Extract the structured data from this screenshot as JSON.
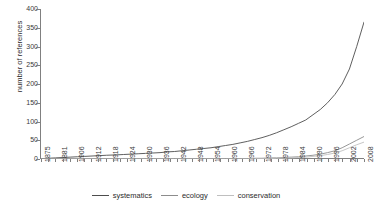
{
  "chart_data": {
    "type": "line",
    "title": "",
    "xlabel": "",
    "ylabel": "number of references",
    "ylim": [
      0,
      400
    ],
    "ytick_values": [
      0,
      50,
      100,
      150,
      200,
      250,
      300,
      350,
      400
    ],
    "grid": false,
    "legend_position": "bottom",
    "xlim": [
      1875,
      2008
    ],
    "xtick_labels": [
      "1875",
      "1881",
      "1906",
      "1912",
      "1918",
      "1924",
      "1930",
      "1936",
      "1942",
      "1948",
      "1954",
      "1960",
      "1966",
      "1972",
      "1978",
      "1984",
      "1990",
      "1996",
      "2002",
      "2008"
    ],
    "x": [
      1875,
      1878,
      1881,
      1884,
      1887,
      1890,
      1893,
      1896,
      1899,
      1902,
      1906,
      1909,
      1912,
      1915,
      1918,
      1921,
      1924,
      1927,
      1930,
      1933,
      1936,
      1939,
      1942,
      1945,
      1948,
      1951,
      1954,
      1957,
      1960,
      1963,
      1966,
      1969,
      1972,
      1975,
      1978,
      1981,
      1984,
      1987,
      1990,
      1993,
      1996,
      1999,
      2002,
      2005,
      2008
    ],
    "series": [
      {
        "name": "systematics",
        "color": "#4d4d4d",
        "values": [
          1,
          2,
          3,
          4,
          5,
          6,
          7,
          8,
          9,
          10,
          11,
          12,
          13,
          14,
          15,
          16,
          17,
          19,
          20,
          22,
          24,
          26,
          28,
          30,
          33,
          36,
          39,
          43,
          47,
          52,
          57,
          63,
          70,
          78,
          86,
          95,
          104,
          118,
          132,
          150,
          172,
          200,
          240,
          300,
          365
        ]
      },
      {
        "name": "ecology",
        "color": "#8c8c8c",
        "values": [
          0,
          0,
          0,
          0,
          0,
          0,
          0,
          0,
          0,
          0,
          0,
          0,
          0,
          0,
          0,
          0,
          0,
          0,
          0,
          0,
          0,
          0,
          0,
          0,
          0,
          0,
          1,
          1,
          1,
          2,
          2,
          3,
          3,
          4,
          5,
          6,
          8,
          10,
          13,
          17,
          22,
          30,
          40,
          50,
          60
        ]
      },
      {
        "name": "conservation",
        "color": "#bfbfbf",
        "values": [
          0,
          0,
          0,
          0,
          0,
          0,
          0,
          0,
          0,
          0,
          0,
          0,
          0,
          0,
          0,
          0,
          0,
          0,
          0,
          0,
          0,
          0,
          0,
          0,
          0,
          0,
          0,
          0,
          0,
          1,
          1,
          1,
          2,
          2,
          3,
          4,
          5,
          7,
          9,
          12,
          16,
          22,
          30,
          38,
          45
        ]
      }
    ]
  },
  "legend": {
    "items": [
      {
        "label": "systematics"
      },
      {
        "label": "ecology"
      },
      {
        "label": "conservation"
      }
    ]
  }
}
